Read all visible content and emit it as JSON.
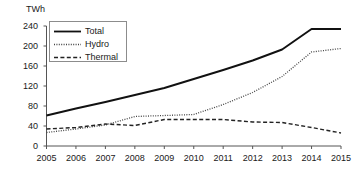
{
  "chart_data": {
    "type": "line",
    "title": "",
    "subtitle": "",
    "xlabel": "",
    "ylabel": "TWh",
    "unit_label": "TWh",
    "categories": [
      "2005",
      "2006",
      "2007",
      "2008",
      "2009",
      "2010",
      "2011",
      "2012",
      "2013",
      "2014",
      "2015"
    ],
    "x": [
      2005,
      2006,
      2007,
      2008,
      2009,
      2010,
      2011,
      2012,
      2013,
      2014,
      2015
    ],
    "xlim": [
      2005,
      2015
    ],
    "ylim": [
      0,
      240
    ],
    "yticks": [
      0,
      40,
      80,
      120,
      160,
      200,
      240
    ],
    "xticks": [
      "2005",
      "2006",
      "2007",
      "2008",
      "2009",
      "2010",
      "2011",
      "2012",
      "2013",
      "2014",
      "2015"
    ],
    "grid": false,
    "legend_position": "top-left",
    "series": [
      {
        "name": "Total",
        "style": "solid",
        "color": "#111111",
        "values": [
          61,
          75,
          88,
          102,
          116,
          134,
          152,
          171,
          193,
          234,
          234
        ]
      },
      {
        "name": "Hydro",
        "style": "dotted",
        "color": "#444444",
        "values": [
          27,
          34,
          42,
          59,
          61,
          63,
          83,
          107,
          139,
          188,
          195
        ]
      },
      {
        "name": "Thermal",
        "style": "dashed",
        "color": "#222222",
        "values": [
          34,
          37,
          44,
          41,
          53,
          53,
          53,
          48,
          47,
          37,
          26
        ]
      }
    ]
  },
  "legend": {
    "items": [
      {
        "label": "Total",
        "style": "solid"
      },
      {
        "label": "Hydro",
        "style": "dotted"
      },
      {
        "label": "Thermal",
        "style": "dashed"
      }
    ]
  }
}
